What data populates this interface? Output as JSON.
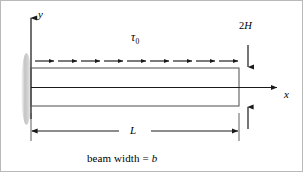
{
  "figure": {
    "kind": "cantilever-beam-shear-traction-diagram",
    "background_color": "#ffffff",
    "line_color": "#1a1a1a",
    "beam_outline_color": "#4d4d4d",
    "support_shading_color": "#c8c8c8"
  },
  "axes": {
    "y_label": "y",
    "x_label": "x"
  },
  "load": {
    "symbol": "τ",
    "subscript": "0",
    "arrow_count": 9,
    "direction": "right"
  },
  "dimensions": {
    "height_label_prefix": "2",
    "height_label_symbol": "H",
    "length_label": "L"
  },
  "caption": {
    "text_prefix": "beam width = ",
    "symbol": "b"
  }
}
